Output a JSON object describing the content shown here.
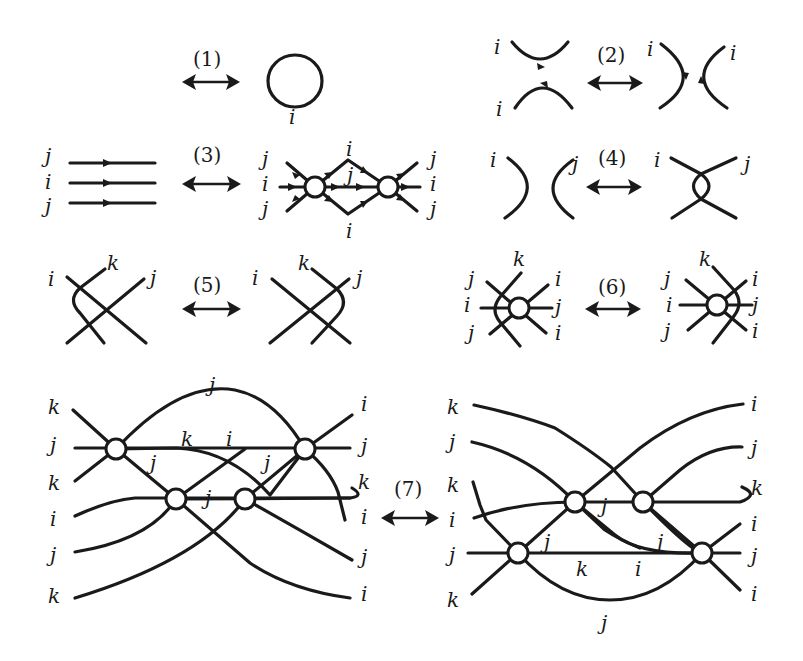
{
  "figure": {
    "moves": [
      {
        "id": "1",
        "label": "(1)",
        "right_labels": [
          "i"
        ]
      },
      {
        "id": "2",
        "label": "(2)",
        "left_labels": [
          "i",
          "i"
        ],
        "right_labels": [
          "i",
          "i"
        ]
      },
      {
        "id": "3",
        "label": "(3)",
        "left_labels": [
          "j",
          "i",
          "j"
        ],
        "right_labels": [
          "j",
          "i",
          "j",
          "i",
          "j",
          "i",
          "j",
          "i",
          "j"
        ]
      },
      {
        "id": "4",
        "label": "(4)",
        "left_labels": [
          "i",
          "j"
        ],
        "right_labels": [
          "i",
          "j"
        ]
      },
      {
        "id": "5",
        "label": "(5)",
        "left_labels": [
          "i",
          "k",
          "j"
        ],
        "right_labels": [
          "i",
          "k",
          "j"
        ]
      },
      {
        "id": "6",
        "label": "(6)",
        "left_labels": [
          "j",
          "k",
          "i",
          "i",
          "j",
          "j",
          "i"
        ],
        "right_labels": [
          "j",
          "k",
          "i",
          "i",
          "j",
          "j",
          "i"
        ]
      },
      {
        "id": "7",
        "label": "(7)",
        "left_labels_left": [
          "k",
          "j",
          "k",
          "i",
          "j",
          "k"
        ],
        "left_labels_right": [
          "i",
          "j",
          "k",
          "i",
          "j",
          "i"
        ],
        "left_inner_labels": [
          "j",
          "k",
          "i",
          "j",
          "j",
          "j"
        ],
        "right_labels_left": [
          "k",
          "j",
          "k",
          "i",
          "j",
          "k"
        ],
        "right_labels_right": [
          "i",
          "j",
          "k",
          "i",
          "j",
          "i"
        ],
        "right_inner_labels": [
          "j",
          "j",
          "j",
          "k",
          "i",
          "j"
        ]
      }
    ]
  },
  "labels": {
    "m1": "(1)",
    "m2": "(2)",
    "m3": "(3)",
    "m4": "(4)",
    "m5": "(5)",
    "m6": "(6)",
    "m7": "(7)",
    "i": "i",
    "j": "j",
    "k": "k"
  }
}
